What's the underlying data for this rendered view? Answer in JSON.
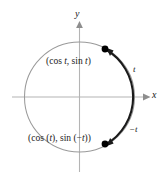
{
  "figure": {
    "background": "#ffffff",
    "axis_color": "#b4b4b4",
    "circle_color": "#999999",
    "arc_color": "#1a1a1a",
    "point_color": "#000000",
    "text_color": "#1a1a1a",
    "axes": {
      "x_label": "x",
      "y_label": "y",
      "origin": {
        "x": 79.5,
        "y": 97
      },
      "x_range": [
        12,
        147
      ],
      "y_range": [
        24,
        172
      ]
    },
    "circle": {
      "center_x": 79.5,
      "center_y": 97,
      "radius": 55
    },
    "points": [
      {
        "name": "upper-point",
        "label": "(cos t, sin t)",
        "label_prefix": "(cos ",
        "label_var1": "t",
        "label_mid": ", sin ",
        "label_var2": "t",
        "label_suffix": ")",
        "x": 105,
        "y": 49
      },
      {
        "name": "lower-point",
        "label": "(cos (t), sin (−t))",
        "label_prefix": "(cos (",
        "label_var1": "t",
        "label_mid": "), sin (−",
        "label_var2": "t",
        "label_suffix": "))",
        "x": 105,
        "y": 144
      }
    ],
    "arc_labels": [
      {
        "name": "arc-label-t",
        "text": "t",
        "x": 133,
        "y": 70
      },
      {
        "name": "arc-label-negative-t",
        "text": "−t",
        "x": 129,
        "y": 130
      }
    ]
  }
}
